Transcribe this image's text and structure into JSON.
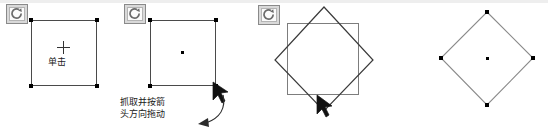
{
  "document": {
    "title": "Rotate object instructional sequence",
    "background_color": "#ffffff",
    "width": 548,
    "height": 131
  },
  "colors": {
    "outline_dark": "#4a4a4a",
    "outline_gray": "#7d7d7d",
    "handle": "#000000",
    "text": "#1a1a1a",
    "icon_box_fill": "#d9d9d9",
    "icon_box_border": "#8a8a8a",
    "top_band": "#eeeeee"
  },
  "panels": [
    {
      "id": "panel-1",
      "name": "select-step",
      "tool_icon": "rotate-icon",
      "shape": "square",
      "marker": "crosshair",
      "caption": "单击",
      "caption_lines": [
        "单击"
      ]
    },
    {
      "id": "panel-2",
      "name": "drag-step",
      "tool_icon": "rotate-icon",
      "shape": "square",
      "marker": "center-dot",
      "cursor": "arrow-cursor",
      "caption": "抓取并按箭头方向拖动",
      "caption_lines": [
        "抓取并按箭",
        "头方向拖动"
      ],
      "arrow": "curved-drag-arrow"
    },
    {
      "id": "panel-3",
      "name": "rotating-step",
      "tool_icon": "rotate-icon",
      "shape": "square-with-rotated-overlay",
      "cursor": "arrow-cursor",
      "caption": "",
      "caption_lines": []
    },
    {
      "id": "panel-4",
      "name": "result-step",
      "tool_icon": "",
      "shape": "rotated-square",
      "marker": "center-dot",
      "caption": "",
      "caption_lines": []
    }
  ]
}
